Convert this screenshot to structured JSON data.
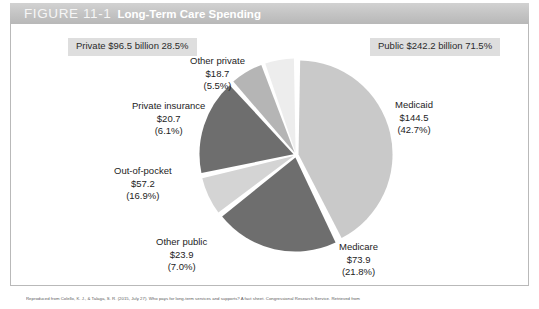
{
  "header": {
    "figure_number": "FIGURE 11-1",
    "title": "Long-Term Care Spending"
  },
  "summary": {
    "private": {
      "label": "Private",
      "amount": "$96.5 billion",
      "percent": "28.5%"
    },
    "public": {
      "label": "Public",
      "amount": "$242.2 billion",
      "percent": "71.5%"
    }
  },
  "labels": {
    "other_private": {
      "name": "Other private",
      "amount": "$18.7",
      "percent": "(5.5%)"
    },
    "private_insurance": {
      "name": "Private insurance",
      "amount": "$20.7",
      "percent": "(6.1%)"
    },
    "out_of_pocket": {
      "name": "Out-of-pocket",
      "amount": "$57.2",
      "percent": "(16.9%)"
    },
    "other_public": {
      "name": "Other public",
      "amount": "$23.9",
      "percent": "(7.0%)"
    },
    "medicare": {
      "name": "Medicare",
      "amount": "$73.9",
      "percent": "(21.8%)"
    },
    "medicaid": {
      "name": "Medicaid",
      "amount": "$144.5",
      "percent": "(42.7%)"
    }
  },
  "footer": {
    "citation": "Reproduced from Colello, K. J., & Talaga, S. R. (2015, July 27). Who pays for long-term services and supports? A fact sheet. Congressional Research Service. Retrieved from"
  },
  "colors": {
    "medicaid": "#c9c9c9",
    "medicare": "#6e6e6e",
    "other_public": "#d4d4d4",
    "out_of_pocket": "#6e6e6e",
    "private_insurance": "#b5b5b5",
    "other_private": "#ededed",
    "header_bar": "#c4c4c4",
    "summary_box": "#dedede"
  },
  "chart_data": {
    "type": "pie",
    "title": "Long-Term Care Spending",
    "unit": "billions of dollars",
    "total_amount": 338.7,
    "legend_position": "callout-labels",
    "categories": [
      "Medicaid",
      "Medicare",
      "Other public",
      "Out-of-pocket",
      "Private insurance",
      "Other private"
    ],
    "values": [
      144.5,
      73.9,
      23.9,
      57.2,
      20.7,
      18.7
    ],
    "percents": [
      42.7,
      21.8,
      7.0,
      16.9,
      6.1,
      5.5
    ],
    "slice_colors": [
      "#c9c9c9",
      "#6e6e6e",
      "#d4d4d4",
      "#6e6e6e",
      "#b5b5b5",
      "#ededed"
    ],
    "groups": [
      {
        "name": "Public",
        "amount": 242.2,
        "percent": 71.5,
        "members": [
          "Medicaid",
          "Medicare",
          "Other public"
        ]
      },
      {
        "name": "Private",
        "amount": 96.5,
        "percent": 28.5,
        "members": [
          "Out-of-pocket",
          "Private insurance",
          "Other private"
        ]
      }
    ]
  }
}
